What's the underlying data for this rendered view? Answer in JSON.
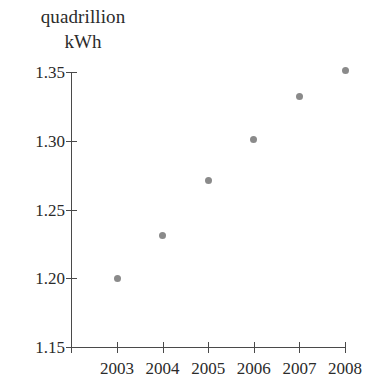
{
  "chart_data": {
    "type": "scatter",
    "title": "",
    "ylabel": "quadrillion kWh",
    "ylabel_lines": [
      "quadrillion",
      "kWh"
    ],
    "xlabel": "",
    "categories": [
      "2003",
      "2004",
      "2005",
      "2006",
      "2007",
      "2008"
    ],
    "x": [
      2003,
      2004,
      2005,
      2006,
      2007,
      2008
    ],
    "values": [
      1.2,
      1.231,
      1.271,
      1.301,
      1.332,
      1.351
    ],
    "xtick_labels": [
      "2003",
      "2004",
      "2005",
      "2006",
      "2007",
      "2008"
    ],
    "ytick_labels": [
      "1.15",
      "1.20",
      "1.25",
      "1.30",
      "1.35"
    ],
    "ytick_values": [
      1.15,
      1.2,
      1.25,
      1.3,
      1.35
    ],
    "ylim": [
      1.15,
      1.35
    ],
    "grid": false,
    "legend": false,
    "marker_color": "#8a8a8a",
    "axis_color": "#4a4a4a"
  }
}
